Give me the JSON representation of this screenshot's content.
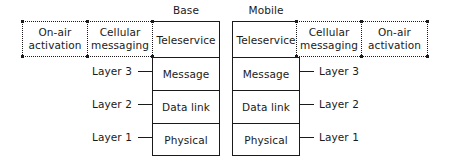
{
  "diagram": {
    "stacks": [
      {
        "id": "base",
        "title": "Base",
        "cells": [
          "Teleservice",
          "Message",
          "Data link",
          "Physical"
        ]
      },
      {
        "id": "mobile",
        "title": "Mobile",
        "cells": [
          "Teleservice",
          "Message",
          "Data link",
          "Physical"
        ]
      }
    ],
    "dashed_groups": {
      "left": [
        {
          "id": "on-air-activation",
          "line1": "On-air",
          "line2": "activation"
        },
        {
          "id": "cellular-messaging",
          "line1": "Cellular",
          "line2": "messaging"
        }
      ],
      "right": [
        {
          "id": "cellular-messaging",
          "line1": "Cellular",
          "line2": "messaging"
        },
        {
          "id": "on-air-activation",
          "line1": "On-air",
          "line2": "activation"
        }
      ]
    },
    "layer_labels": {
      "left": [
        "Layer 3",
        "Layer 2",
        "Layer 1"
      ],
      "right": [
        "Layer 3",
        "Layer 2",
        "Layer 1"
      ]
    },
    "colors": {
      "ink": "#1a1a1a",
      "background": "#ffffff"
    }
  }
}
